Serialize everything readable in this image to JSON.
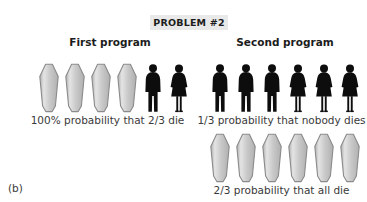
{
  "figure": {
    "panel_label": "(b)",
    "title": "PROBLEM #2",
    "title_background": "#e9e9e9"
  },
  "colors": {
    "text": "#3a3a3a",
    "heading": "#1c1c1c",
    "coffin_fill_light": "#e4e4e4",
    "coffin_fill_mid": "#c9c9c9",
    "coffin_fill_dark": "#b0b0b0",
    "coffin_outline": "#8a8a8a",
    "person_fill": "#0d0d0d",
    "background": "#ffffff"
  },
  "columns": [
    {
      "heading": "First program",
      "groups": [
        {
          "icons": [
            {
              "type": "coffin-icon"
            },
            {
              "type": "coffin-icon"
            },
            {
              "type": "coffin-icon"
            },
            {
              "type": "coffin-icon"
            },
            {
              "type": "person-male-icon"
            },
            {
              "type": "person-female-icon"
            }
          ],
          "coffin_count": 4,
          "male_count": 1,
          "female_count": 1,
          "caption": "100% probability that 2/3 die"
        }
      ]
    },
    {
      "heading": "Second program",
      "groups": [
        {
          "icons": [
            {
              "type": "person-male-icon"
            },
            {
              "type": "person-male-icon"
            },
            {
              "type": "person-male-icon"
            },
            {
              "type": "person-female-icon"
            },
            {
              "type": "person-female-icon"
            },
            {
              "type": "person-female-icon"
            }
          ],
          "coffin_count": 0,
          "male_count": 3,
          "female_count": 3,
          "caption": "1/3 probability that nobody dies"
        },
        {
          "icons": [
            {
              "type": "coffin-icon"
            },
            {
              "type": "coffin-icon"
            },
            {
              "type": "coffin-icon"
            },
            {
              "type": "coffin-icon"
            },
            {
              "type": "coffin-icon"
            },
            {
              "type": "coffin-icon"
            }
          ],
          "coffin_count": 6,
          "male_count": 0,
          "female_count": 0,
          "caption": "2/3 probability that all die"
        }
      ]
    }
  ]
}
